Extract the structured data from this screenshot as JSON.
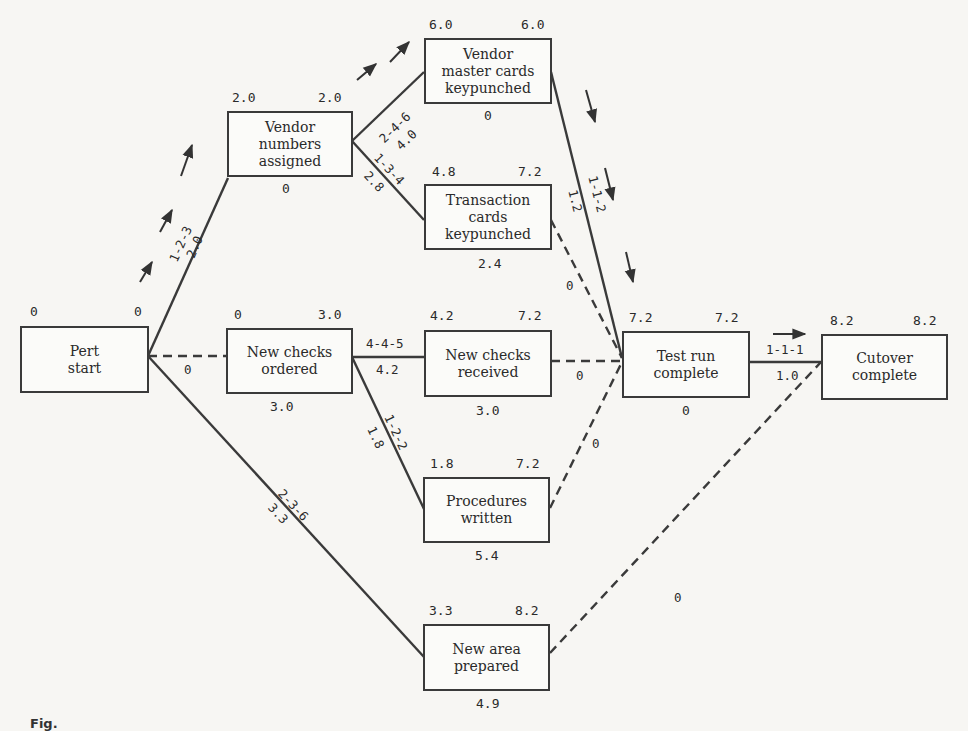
{
  "diagram": {
    "type": "PERT network",
    "nodes": {
      "pert_start": {
        "label": "Pert\nstart",
        "early": "0",
        "late": "0",
        "slack": ""
      },
      "vendor_numbers": {
        "label": "Vendor\nnumbers\nassigned",
        "early": "2.0",
        "late": "2.0",
        "slack": "0"
      },
      "vendor_master": {
        "label": "Vendor\nmaster cards\nkeypunched",
        "early": "6.0",
        "late": "6.0",
        "slack": "0"
      },
      "transaction_cards": {
        "label": "Transaction\ncards\nkeypunched",
        "early": "4.8",
        "late": "7.2",
        "slack": "2.4"
      },
      "new_checks_ordered": {
        "label": "New checks\nordered",
        "early": "0",
        "late": "3.0",
        "slack": "3.0"
      },
      "new_checks_received": {
        "label": "New checks\nreceived",
        "early": "4.2",
        "late": "7.2",
        "slack": "3.0"
      },
      "procedures_written": {
        "label": "Procedures\nwritten",
        "early": "1.8",
        "late": "7.2",
        "slack": "5.4"
      },
      "new_area": {
        "label": "New area\nprepared",
        "early": "3.3",
        "late": "8.2",
        "slack": "4.9"
      },
      "test_run": {
        "label": "Test run\ncomplete",
        "early": "7.2",
        "late": "7.2",
        "slack": "0"
      },
      "cutover": {
        "label": "Cutover\ncomplete",
        "early": "8.2",
        "late": "8.2",
        "slack": ""
      }
    },
    "edges": [
      {
        "from": "pert_start",
        "to": "vendor_numbers",
        "estimate": "1-2-3",
        "expected": "2.0",
        "critical": true
      },
      {
        "from": "pert_start",
        "to": "new_checks_ordered",
        "estimate": "",
        "expected": "0",
        "dummy": true
      },
      {
        "from": "pert_start",
        "to": "new_area",
        "estimate": "2-3-6",
        "expected": "3.3"
      },
      {
        "from": "vendor_numbers",
        "to": "vendor_master",
        "estimate": "2-4-6",
        "expected": "4.0",
        "critical": true
      },
      {
        "from": "vendor_numbers",
        "to": "transaction_cards",
        "estimate": "1-3-4",
        "expected": "2.8"
      },
      {
        "from": "vendor_master",
        "to": "test_run",
        "estimate": "1-1-2",
        "expected": "1.2",
        "critical": true
      },
      {
        "from": "transaction_cards",
        "to": "test_run",
        "estimate": "",
        "expected": "0",
        "dummy": true
      },
      {
        "from": "new_checks_ordered",
        "to": "new_checks_received",
        "estimate": "4-4-5",
        "expected": "4.2"
      },
      {
        "from": "new_checks_ordered",
        "to": "procedures_written",
        "estimate": "1-2-2",
        "expected": "1.8"
      },
      {
        "from": "new_checks_received",
        "to": "test_run",
        "estimate": "",
        "expected": "0",
        "dummy": true
      },
      {
        "from": "procedures_written",
        "to": "test_run",
        "estimate": "",
        "expected": "0",
        "dummy": true
      },
      {
        "from": "test_run",
        "to": "cutover",
        "estimate": "1-1-1",
        "expected": "1.0",
        "critical": true
      },
      {
        "from": "new_area",
        "to": "cutover",
        "estimate": "",
        "expected": "0",
        "dummy": true
      }
    ],
    "caption": "Fig."
  }
}
